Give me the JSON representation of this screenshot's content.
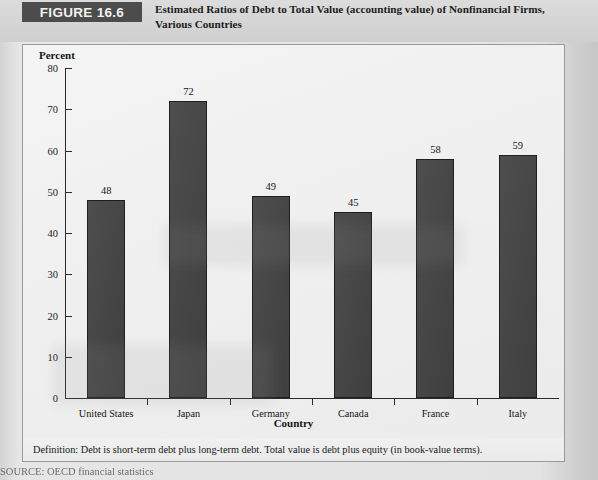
{
  "header": {
    "figure_banner": "FIGURE 16.6",
    "title_line1": "Estimated Ratios of Debt to Total Value (accounting value) of Nonfinancial Firms,",
    "title_line2": "Various Countries"
  },
  "footnote": {
    "text": "Definition: Debt is short-term debt plus long-term debt. Total value is debt plus equity (in book-value terms)."
  },
  "source": {
    "text": "SOURCE: OECD financial statistics"
  },
  "chart_data": {
    "type": "bar",
    "title": "Estimated Ratios of Debt to Total Value (accounting value) of Nonfinancial Firms, Various Countries",
    "xlabel": "Country",
    "ylabel": "Percent",
    "categories": [
      "United States",
      "Japan",
      "Germany",
      "Canada",
      "France",
      "Italy"
    ],
    "values": [
      48,
      72,
      49,
      45,
      58,
      59
    ],
    "ylim": [
      0,
      80
    ],
    "yticks": [
      0,
      10,
      20,
      30,
      40,
      50,
      60,
      70,
      80
    ],
    "ytick_step": 10,
    "grid": false,
    "legend": false,
    "data_labels": true,
    "bar_color": "#474747",
    "bar_edge_color": "#1f1f1f",
    "background_color": "#f0f0f0"
  }
}
